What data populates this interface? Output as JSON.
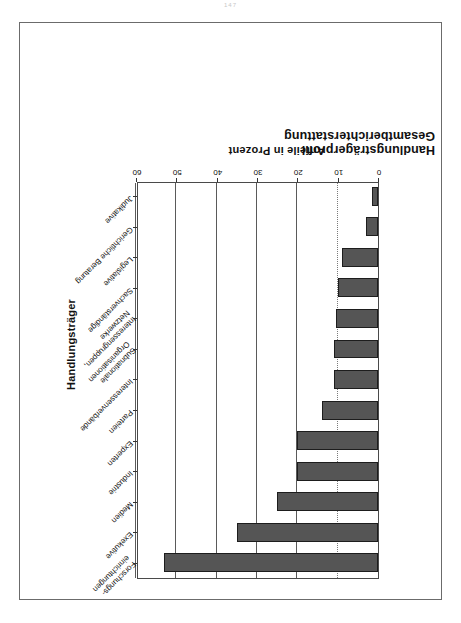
{
  "page": {
    "number": "147"
  },
  "chart_data": {
    "type": "bar",
    "orientation": "vertical-rotated-180",
    "title_line1": "Handlungsträgerprofil",
    "title_line2": "Gesamtberichterstattung",
    "xlabel": "Handlungsträger",
    "ylabel": "Anteile in Prozent",
    "ylim": [
      0,
      60
    ],
    "yticks": [
      0,
      10,
      20,
      30,
      40,
      50,
      60
    ],
    "ytick_labels": [
      "0",
      "10",
      "20",
      "30",
      "40",
      "50",
      "60"
    ],
    "grid": true,
    "legend": "none",
    "categories": [
      "Forschungs-\neinrichtungen",
      "Exekutive",
      "Medien",
      "Industrie",
      "Experten",
      "Parteien",
      "Interessenverbände",
      "Subnationale\nOrganisationen",
      "Interessengruppen,\nNetzwerke",
      "Sachverständige",
      "Legislative",
      "Gerichtliche Beratung",
      "Judikative"
    ],
    "values": [
      53,
      35,
      25,
      20,
      20,
      14,
      11,
      11,
      10.5,
      10,
      9,
      3,
      1.5
    ],
    "bar_color": "#555555",
    "bar_edge_color": "#1d1d1d",
    "axis_color": "#4a4a4a",
    "frame_color": "#6b6b6b"
  }
}
